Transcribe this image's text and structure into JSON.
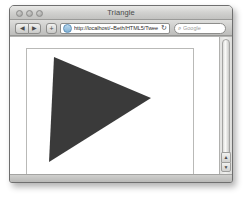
{
  "window": {
    "title": "Triangle",
    "traffic_lights": [
      {
        "name": "close",
        "label": ""
      },
      {
        "name": "minimize",
        "label": ""
      },
      {
        "name": "zoom",
        "label": ""
      }
    ]
  },
  "toolbar": {
    "back_label": "◀",
    "forward_label": "▶",
    "add_label": "+",
    "address": {
      "icon": "globe-icon",
      "value": "http://localhost/~Beth/HTML5/Twee",
      "placeholder": "Enter address",
      "reload_label": "↻"
    },
    "search": {
      "icon": "magnifier-icon",
      "glyph": "⌕",
      "value": "",
      "placeholder": "Google"
    }
  },
  "scrollbar": {
    "up_arrow": "▲",
    "down_arrow": "▼"
  },
  "page": {
    "canvas": {
      "name": "triangle-canvas",
      "background": "#ffffff",
      "border_color": "#b9b9b7",
      "shape": {
        "type": "triangle",
        "fill": "#3a3a3a",
        "points": "27,8 124,49 22,113"
      }
    }
  }
}
